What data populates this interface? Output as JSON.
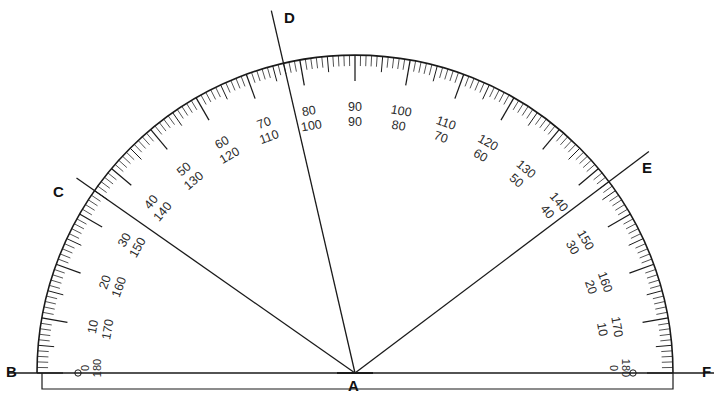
{
  "figure": {
    "type": "protractor-diagram",
    "background": "#ffffff",
    "ink": "#1a1a1a"
  },
  "geometry": {
    "center": {
      "x": 355,
      "y": 373,
      "label": "A"
    },
    "radius": 318,
    "baseline": {
      "y": 373,
      "x_start": 8,
      "x_end": 714
    },
    "base_rect": {
      "x": 42,
      "y": 373,
      "width": 631,
      "height": 16
    }
  },
  "points": [
    {
      "id": "A",
      "label": "A",
      "x": 355,
      "y": 373,
      "role": "vertex"
    },
    {
      "id": "B",
      "label": "B",
      "x": 10,
      "y": 373,
      "role": "baseline-left-end"
    },
    {
      "id": "C",
      "label": "C",
      "x": 59,
      "y": 194,
      "role": "ray-endpoint",
      "angle_deg": 145
    },
    {
      "id": "D",
      "label": "D",
      "x": 290,
      "y": 18,
      "role": "ray-endpoint",
      "angle_deg": 103
    },
    {
      "id": "E",
      "label": "E",
      "x": 648,
      "y": 170,
      "role": "ray-endpoint",
      "angle_deg": 37
    },
    {
      "id": "F",
      "label": "F",
      "x": 706,
      "y": 373,
      "role": "baseline-right-end"
    }
  ],
  "rays": [
    {
      "from": "A",
      "to": "C",
      "angle_deg": 145,
      "length": 340
    },
    {
      "from": "A",
      "to": "D",
      "angle_deg": 103,
      "length": 372
    },
    {
      "from": "A",
      "to": "E",
      "angle_deg": 37,
      "length": 368
    }
  ],
  "scale": {
    "description": "Double-numbered protractor scale, outer 0-180 counterclockwise from right, inner 0-180 clockwise from left",
    "major_step_deg": 10,
    "minor_step_deg": 1,
    "mid_step_deg": 5,
    "labels": [
      {
        "angle_deg": 180,
        "outer": "0",
        "inner": "180"
      },
      {
        "angle_deg": 170,
        "outer": "10",
        "inner": "170"
      },
      {
        "angle_deg": 160,
        "outer": "20",
        "inner": "160"
      },
      {
        "angle_deg": 150,
        "outer": "30",
        "inner": "150"
      },
      {
        "angle_deg": 140,
        "outer": "40",
        "inner": "140"
      },
      {
        "angle_deg": 130,
        "outer": "50",
        "inner": "130"
      },
      {
        "angle_deg": 120,
        "outer": "60",
        "inner": "120"
      },
      {
        "angle_deg": 110,
        "outer": "70",
        "inner": "110"
      },
      {
        "angle_deg": 100,
        "outer": "80",
        "inner": "100"
      },
      {
        "angle_deg": 90,
        "outer": "90",
        "inner": "90"
      },
      {
        "angle_deg": 80,
        "outer": "100",
        "inner": "80"
      },
      {
        "angle_deg": 70,
        "outer": "110",
        "inner": "70"
      },
      {
        "angle_deg": 60,
        "outer": "120",
        "inner": "60"
      },
      {
        "angle_deg": 50,
        "outer": "130",
        "inner": "50"
      },
      {
        "angle_deg": 40,
        "outer": "140",
        "inner": "40"
      },
      {
        "angle_deg": 30,
        "outer": "150",
        "inner": "30"
      },
      {
        "angle_deg": 20,
        "outer": "160",
        "inner": "20"
      },
      {
        "angle_deg": 10,
        "outer": "170",
        "inner": "10"
      },
      {
        "angle_deg": 0,
        "outer": "180",
        "inner": "0"
      }
    ],
    "end_labels": {
      "left_top": "0",
      "left_bottom": "180",
      "right_top": "180",
      "right_bottom": "0"
    }
  },
  "vertex_labels": {
    "A": "A",
    "B": "B",
    "C": "C",
    "D": "D",
    "E": "E",
    "F": "F"
  }
}
